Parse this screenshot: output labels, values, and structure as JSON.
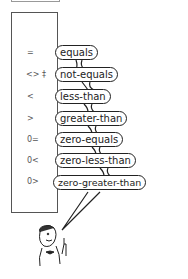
{
  "rows": [
    {
      "symbol": "=",
      "word": "equals"
    },
    {
      "symbol": "<> ‡",
      "word": "not-equals"
    },
    {
      "symbol": "<",
      "word": "less-than"
    },
    {
      "symbol": ">",
      "word": "greater-than"
    },
    {
      "symbol": "0=",
      "word": "zero-equals"
    },
    {
      "symbol": "0<",
      "word": "zero-less-than"
    },
    {
      "symbol": "0>",
      "word": "zero-greater-than"
    }
  ],
  "figure": "cartoon-man-pointing"
}
